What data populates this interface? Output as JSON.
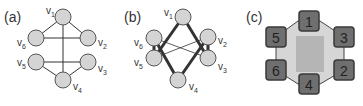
{
  "panels": [
    {
      "label": "(a)",
      "vertices": [
        {
          "id": "v1",
          "name": "v",
          "sub": "1",
          "x": 63,
          "y": 17,
          "lx": 46,
          "ly": 14
        },
        {
          "id": "v2",
          "name": "v",
          "sub": "2",
          "x": 88,
          "y": 38,
          "lx": 98,
          "ly": 46
        },
        {
          "id": "v3",
          "name": "v",
          "sub": "3",
          "x": 88,
          "y": 62,
          "lx": 98,
          "ly": 72
        },
        {
          "id": "v4",
          "name": "v",
          "sub": "4",
          "x": 63,
          "y": 80,
          "lx": 73,
          "ly": 90
        },
        {
          "id": "v5",
          "name": "v",
          "sub": "5",
          "x": 36,
          "y": 62,
          "lx": 17,
          "ly": 66
        },
        {
          "id": "v6",
          "name": "v",
          "sub": "6",
          "x": 36,
          "y": 38,
          "lx": 17,
          "ly": 46
        }
      ],
      "edges": [
        [
          "v1",
          "v6"
        ],
        [
          "v1",
          "v2"
        ],
        [
          "v1",
          "v4"
        ],
        [
          "v6",
          "v2"
        ],
        [
          "v5",
          "v3"
        ],
        [
          "v5",
          "v4"
        ],
        [
          "v3",
          "v4"
        ]
      ]
    },
    {
      "label": "(b)",
      "vertices": [
        {
          "id": "v1",
          "name": "v",
          "sub": "1",
          "x": 183,
          "y": 17,
          "lx": 164,
          "ly": 16
        },
        {
          "id": "v2",
          "name": "v",
          "sub": "2",
          "x": 208,
          "y": 37,
          "lx": 218,
          "ly": 44
        },
        {
          "id": "v3",
          "name": "v",
          "sub": "3",
          "x": 208,
          "y": 58,
          "lx": 218,
          "ly": 70
        },
        {
          "id": "v4",
          "name": "v",
          "sub": "4",
          "x": 178,
          "y": 80,
          "lx": 189,
          "ly": 90
        },
        {
          "id": "v5",
          "name": "v",
          "sub": "5",
          "x": 154,
          "y": 58,
          "lx": 134,
          "ly": 66
        },
        {
          "id": "v6",
          "name": "v",
          "sub": "6",
          "x": 154,
          "y": 38,
          "lx": 134,
          "ly": 46
        }
      ],
      "thick_edges": [
        [
          "v1",
          "v5"
        ],
        [
          "v1",
          "v3"
        ],
        [
          "v6",
          "v4"
        ],
        [
          "v2",
          "v4"
        ],
        [
          "v6",
          "v5"
        ],
        [
          "v2",
          "v3"
        ]
      ],
      "thin_edges": [
        [
          "v6",
          "v3"
        ],
        [
          "v5",
          "v2"
        ]
      ]
    },
    {
      "label": "(c)",
      "squares": [
        {
          "label": "1",
          "x": 309,
          "y": 21
        },
        {
          "label": "3",
          "x": 344,
          "y": 37
        },
        {
          "label": "2",
          "x": 344,
          "y": 70
        },
        {
          "label": "4",
          "x": 309,
          "y": 84
        },
        {
          "label": "6",
          "x": 276,
          "y": 70
        },
        {
          "label": "5",
          "x": 276,
          "y": 37
        }
      ]
    }
  ],
  "colors": {
    "node_fill": "#d4d4d4",
    "node_stroke": "#555555",
    "edge": "#333333",
    "square_fill": "#6f6f6f",
    "square_stroke": "#3a3a3a",
    "octagon_fill": "#d6d6d6",
    "octagon_stroke": "#444444",
    "center_fill": "#b5b5b5"
  }
}
